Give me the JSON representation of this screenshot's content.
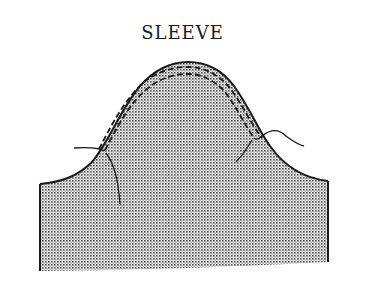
{
  "diagram": {
    "title": "SLEEVE",
    "colors": {
      "outline": "#1a1a1a",
      "fill_dot": "#555555",
      "background": "#ffffff"
    },
    "elements": [
      {
        "name": "sleeve-piece",
        "description": "stippled sleeve pattern with curved cap"
      },
      {
        "name": "ease-stitch-outer",
        "description": "dashed stitching line near cap edge"
      },
      {
        "name": "ease-stitch-inner",
        "description": "second dashed stitching line inside cap"
      },
      {
        "name": "thread-tail-left",
        "description": "loose thread ends on left side"
      },
      {
        "name": "thread-tail-right",
        "description": "loose thread ends on right side"
      }
    ]
  }
}
